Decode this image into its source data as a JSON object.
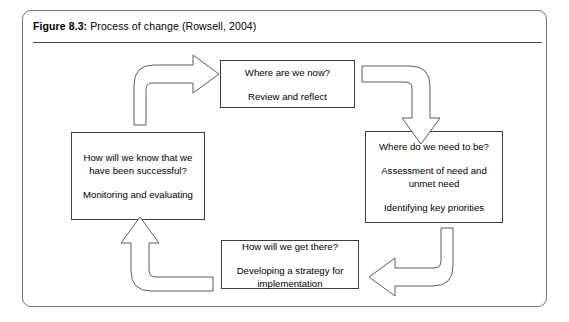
{
  "figure": {
    "caption_label": "Figure 8.3:",
    "caption_text": " Process of change (Rowsell, 2004)"
  },
  "diagram": {
    "type": "cycle",
    "direction": "clockwise",
    "colors": {
      "background": "#ffffff",
      "box_border": "#3c3f42",
      "arrow_stroke": "#5a5d61",
      "frame_border": "#6f7276",
      "text": "#000000"
    },
    "boxes": [
      {
        "id": "where-are-we-now",
        "position": "top",
        "lines": [
          "Where are we now?",
          "Review and reflect"
        ]
      },
      {
        "id": "where-do-we-need-to-be",
        "position": "right",
        "lines": [
          "Where do we need to be?",
          "Assessment of need and unmet need",
          "Identifying key priorities"
        ]
      },
      {
        "id": "how-will-we-get-there",
        "position": "bottom",
        "lines": [
          "How will we get there?",
          "Developing a strategy for implementation"
        ]
      },
      {
        "id": "how-will-we-know",
        "position": "left",
        "lines": [
          "How will we know that we have been successful?",
          "Monitoring and evaluating"
        ]
      }
    ],
    "arrows": [
      {
        "id": "left-to-top",
        "from": "how-will-we-know",
        "to": "where-are-we-now",
        "shape": "up-then-right"
      },
      {
        "id": "top-to-right",
        "from": "where-are-we-now",
        "to": "where-do-we-need-to-be",
        "shape": "right-then-down"
      },
      {
        "id": "right-to-bottom",
        "from": "where-do-we-need-to-be",
        "to": "how-will-we-get-there",
        "shape": "down-then-left"
      },
      {
        "id": "bottom-to-left",
        "from": "how-will-we-get-there",
        "to": "how-will-we-know",
        "shape": "left-then-up"
      }
    ]
  }
}
